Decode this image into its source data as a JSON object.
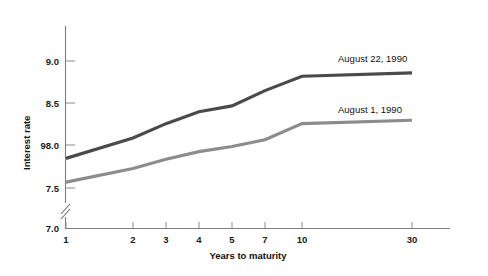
{
  "chart_data": {
    "type": "line",
    "title": "",
    "xlabel": "Years to maturity",
    "ylabel": "Interest rate",
    "x": [
      1,
      2,
      3,
      4,
      5,
      7,
      10,
      30
    ],
    "categories": [
      "1",
      "2",
      "3",
      "4",
      "5",
      "7",
      "10",
      "30"
    ],
    "xtick_labels": [
      "1",
      "2",
      "3",
      "4",
      "5",
      "7",
      "10",
      "30"
    ],
    "ytick_labels": [
      "7.0",
      "7.5",
      "98.0",
      "8.5",
      "9.0"
    ],
    "ytick_values": [
      7.0,
      7.5,
      8.0,
      8.5,
      9.0
    ],
    "ylim": [
      7.0,
      9.35
    ],
    "y_axis_break": true,
    "y_axis_break_note": "Axis broken between 7.0 and 7.5",
    "grid": false,
    "legend_position": "inline-right",
    "series": [
      {
        "name": "August 22, 1990",
        "color": "#4a4a4a",
        "linewidth": 3.2,
        "values": [
          7.85,
          8.09,
          8.26,
          8.4,
          8.47,
          8.65,
          8.82,
          8.86
        ]
      },
      {
        "name": "August 1, 1990",
        "color": "#8c8c8c",
        "linewidth": 3.2,
        "values": [
          7.57,
          7.73,
          7.84,
          7.93,
          7.99,
          8.07,
          8.26,
          8.3
        ]
      }
    ],
    "annotations": [
      {
        "text": "August 22, 1990",
        "series": "August 22, 1990"
      },
      {
        "text": "August 1, 1990",
        "series": "August 1, 1990"
      }
    ]
  },
  "axis": {
    "y_title": "Interest rate",
    "x_title": "Years to maturity"
  },
  "labels": {
    "y0": "7.0",
    "y1": "7.5",
    "y2": "98.0",
    "y3": "8.5",
    "y4": "9.0",
    "x0": "1",
    "x1": "2",
    "x2": "3",
    "x3": "4",
    "x4": "5",
    "x5": "7",
    "x6": "10",
    "x7": "30",
    "series_top": "August 22, 1990",
    "series_bottom": "August 1, 1990"
  },
  "colors": {
    "series_top": "#4a4a4a",
    "series_bottom": "#8c8c8c",
    "axis": "#7d7d7d",
    "text": "#111111",
    "background": "#ffffff"
  }
}
